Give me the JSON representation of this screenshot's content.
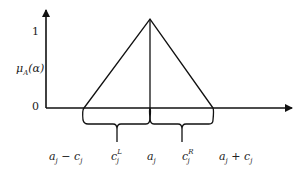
{
  "diagram": {
    "type": "triangular membership function",
    "y_axis": {
      "label": "μ",
      "label_sub": "A",
      "label_arg": "(α)",
      "ticks": [
        "1",
        "0"
      ]
    },
    "x_labels": {
      "left_base": {
        "a": "a",
        "sub": "j",
        "op": " − ",
        "c": "c",
        "csub": "j"
      },
      "left_spread": {
        "c": "c",
        "sup": "L",
        "sub": "j"
      },
      "center": {
        "a": "a",
        "sub": "j"
      },
      "right_spread": {
        "c": "c",
        "sup": "R",
        "sub": "j"
      },
      "right_base": {
        "a": "a",
        "sub": "j",
        "op": " + ",
        "c": "c",
        "csub": "j"
      }
    },
    "colors": {
      "stroke": "#111111",
      "text": "#222222"
    }
  }
}
